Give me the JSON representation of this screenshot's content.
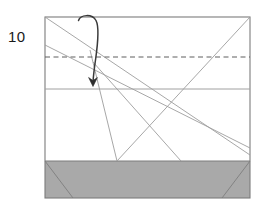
{
  "figure": {
    "step_label": "10",
    "colors": {
      "paper_fill": "#ffffff",
      "shaded_fill": "#a9a9a9",
      "outline": "#7a7a7a",
      "crease_line": "#9a9a9a",
      "dashed_crease": "#6e6e6e",
      "arrow": "#3a3a3a",
      "label_text": "#1a1a1a"
    },
    "shape": {
      "type": "rectangle",
      "left": 45,
      "top": 17,
      "right": 250,
      "bottom": 198,
      "width": 205,
      "height": 181
    },
    "shaded_band": {
      "name": "bottom-shaded-band",
      "top": 161,
      "bottom": 198,
      "left": 45,
      "right": 250
    },
    "horizontal_creases": [
      {
        "name": "mid-horizontal-crease",
        "y": 89,
        "style": "solid"
      },
      {
        "name": "shaded-band-top-edge",
        "y": 161,
        "style": "solid"
      }
    ],
    "dashed_crease": {
      "name": "valley-fold-dashed-line",
      "y": 57,
      "x1": 45,
      "x2": 250,
      "style": "dashed"
    },
    "diagonal_creases": [
      {
        "name": "crease-top-left-to-bottom-right",
        "x1": 45,
        "y1": 17,
        "x2": 250,
        "y2": 155
      },
      {
        "name": "crease-left-edge-to-lower-right",
        "x1": 45,
        "y1": 45,
        "x2": 250,
        "y2": 148
      },
      {
        "name": "crease-upper-area-to-band-left",
        "x1": 93,
        "y1": 62,
        "x2": 117,
        "y2": 161
      },
      {
        "name": "crease-top-right-to-band-left-long",
        "x1": 250,
        "y1": 17,
        "x2": 117,
        "y2": 161
      },
      {
        "name": "crease-convergence-to-band-right",
        "x1": 93,
        "y1": 62,
        "x2": 181,
        "y2": 161
      },
      {
        "name": "band-crease-left",
        "x1": 45,
        "y1": 161,
        "x2": 73,
        "y2": 198
      },
      {
        "name": "band-crease-right",
        "x1": 250,
        "y1": 161,
        "x2": 222,
        "y2": 198
      }
    ],
    "arrow": {
      "name": "fold-down-arrow",
      "direction": "down",
      "description": "curved arrow from top edge looping over and pointing down to the mid horizontal crease",
      "start": {
        "x": 78,
        "y": 20
      },
      "end": {
        "x": 93,
        "y": 86
      }
    }
  }
}
